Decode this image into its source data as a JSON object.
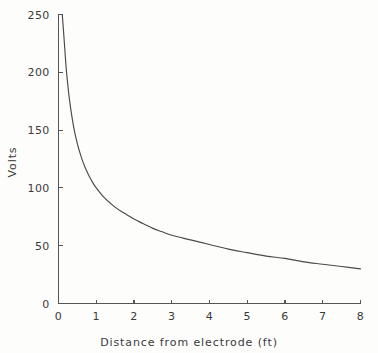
{
  "chart_data": {
    "type": "line",
    "title": "",
    "subtitle": "",
    "xlabel": "Distance from electrode (ft)",
    "ylabel": "Volts",
    "xlim": [
      0,
      8
    ],
    "ylim": [
      0,
      250
    ],
    "grid": false,
    "legend": null,
    "x_ticks": [
      0,
      1,
      2,
      3,
      4,
      5,
      6,
      7,
      8
    ],
    "x_tick_labels": [
      "0",
      "1",
      "2",
      "3",
      "4",
      "5",
      "6",
      "7",
      "8"
    ],
    "y_ticks": [
      0,
      50,
      100,
      150,
      200,
      250
    ],
    "y_tick_labels": [
      "0",
      "50",
      "100",
      "150",
      "200",
      "250"
    ],
    "series": [
      {
        "name": "Voltage vs distance",
        "x": [
          0.1,
          0.15,
          0.2,
          0.25,
          0.3,
          0.4,
          0.5,
          0.6,
          0.7,
          0.8,
          0.9,
          1.0,
          1.2,
          1.4,
          1.6,
          1.8,
          2.0,
          2.25,
          2.5,
          2.75,
          3.0,
          3.5,
          4.0,
          4.5,
          5.0,
          5.5,
          6.0,
          6.5,
          7.0,
          7.5,
          8.0
        ],
        "y": [
          250,
          228,
          205,
          188,
          174,
          153,
          138,
          127,
          118,
          111,
          105,
          100,
          92,
          86,
          81,
          77,
          73,
          69,
          65,
          62,
          59,
          55,
          51,
          47,
          44,
          41,
          39,
          36,
          34,
          32,
          30
        ]
      }
    ],
    "colors": {
      "curve": "#4a4a4a",
      "axis": "#555555",
      "text": "#3a3a3a",
      "background": "#fdfdfc"
    }
  },
  "axes": {
    "x_title": "Distance from electrode (ft)",
    "y_title": "Volts"
  }
}
